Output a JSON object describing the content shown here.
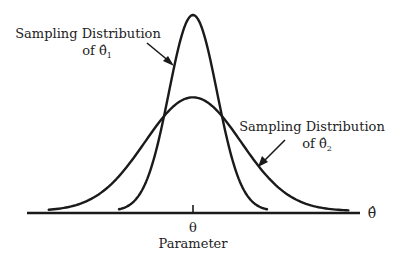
{
  "chart_data": {
    "type": "line",
    "title": "",
    "xlabel": "θ̂",
    "ylabel": "",
    "grid": false,
    "x_ticks": [
      {
        "value": 0,
        "label": "θ"
      }
    ],
    "x_tick_caption": "Parameter",
    "xlim": [
      -4.5,
      4.5
    ],
    "series": [
      {
        "name": "Sampling Distribution of θ̂₁",
        "label_line1": "Sampling Distribution",
        "label_line2_prefix": "of θ̂",
        "label_subscript": "1",
        "distribution": "normal",
        "mean": 0,
        "sd": 0.65,
        "relative_peak": 1.0,
        "x_range": [
          -2,
          2
        ],
        "annotation_position": "top-left"
      },
      {
        "name": "Sampling Distribution of θ̂₂",
        "label_line1": "Sampling Distribution",
        "label_line2_prefix": "of θ̂",
        "label_subscript": "2",
        "distribution": "normal",
        "mean": 0,
        "sd": 1.3,
        "relative_peak": 0.58,
        "x_range": [
          -3.9,
          4.2
        ],
        "annotation_position": "right"
      }
    ]
  }
}
